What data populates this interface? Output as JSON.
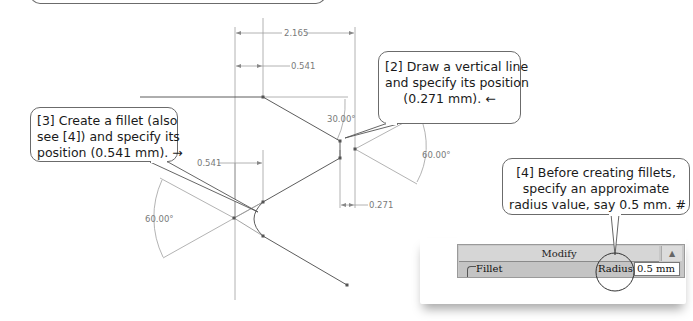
{
  "callouts": {
    "step2": {
      "lines": [
        "[2] Draw a vertical line",
        "and specify its position",
        "(0.271 mm).  ←"
      ]
    },
    "step3": {
      "lines": [
        "[3] Create a fillet (also",
        "see [4]) and specify its",
        "position (0.541 mm).  →"
      ]
    },
    "step4": {
      "lines": [
        "[4] Before creating fillets,",
        "specify an approximate",
        "radius value, say 0.5 mm.  #"
      ]
    }
  },
  "dimensions": {
    "overall_width": "2.165",
    "top_offset": "0.541",
    "left_offset": "0.541",
    "right_offset": "0.271",
    "angle_top": "30.00°",
    "angle_left": "60.00°",
    "angle_right": "60.00°"
  },
  "modify_panel": {
    "title": "Modify",
    "scroll_glyph": "▲",
    "fillet_label": "Fillet",
    "radius_label": "Radius:",
    "radius_value": "0.5 mm"
  },
  "colors": {
    "line": "#555555",
    "dim_line": "#9a9a9a",
    "callout_border": "#6b6b6b",
    "panel_bg": "#c8c8c8"
  }
}
